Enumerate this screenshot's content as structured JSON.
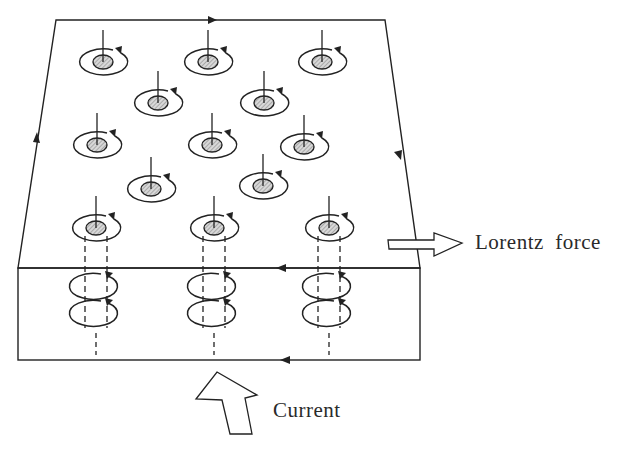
{
  "diagram": {
    "labels": {
      "lorentz_force": "Lorentz  force",
      "current": "Current"
    },
    "colors": {
      "stroke": "#222222",
      "core_fill": "#bdbdbd",
      "background": "#ffffff"
    },
    "slab": {
      "top_face": [
        [
          56,
          20
        ],
        [
          385,
          20
        ],
        [
          420,
          268
        ],
        [
          18,
          268
        ]
      ],
      "front_face": {
        "x": 18,
        "y": 268,
        "width": 402,
        "height": 92
      }
    },
    "surface_vortices": [
      {
        "x": 103,
        "y": 62
      },
      {
        "x": 208,
        "y": 62
      },
      {
        "x": 322,
        "y": 62
      },
      {
        "x": 158,
        "y": 103
      },
      {
        "x": 264,
        "y": 103
      },
      {
        "x": 97,
        "y": 145
      },
      {
        "x": 212,
        "y": 145
      },
      {
        "x": 304,
        "y": 147
      },
      {
        "x": 151,
        "y": 189
      },
      {
        "x": 263,
        "y": 186
      }
    ],
    "tube_vortices": [
      {
        "x": 96,
        "y": 228
      },
      {
        "x": 214,
        "y": 228
      },
      {
        "x": 329,
        "y": 228
      }
    ],
    "current_loop_arrows": [
      "top edge: rightward",
      "right edge: downward",
      "front top edge: leftward",
      "front bottom edge: leftward",
      "left edge: upward"
    ]
  }
}
